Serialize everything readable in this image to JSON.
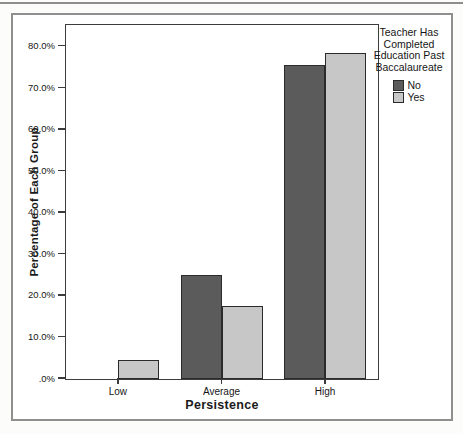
{
  "chart_data": {
    "type": "bar",
    "title": "",
    "categories": [
      "Low",
      "Average",
      "High"
    ],
    "series": [
      {
        "name": "No",
        "color": "#5b5b5b",
        "values": [
          0.0,
          25.0,
          75.5
        ]
      },
      {
        "name": "Yes",
        "color": "#c7c7c7",
        "values": [
          4.5,
          17.5,
          78.5
        ]
      }
    ],
    "xlabel": "Persistence",
    "ylabel": "Percentage of Each Group",
    "ylim": [
      0,
      85
    ],
    "yticks": [
      {
        "value": 0,
        "label": ".0%"
      },
      {
        "value": 10,
        "label": "10.0%"
      },
      {
        "value": 20,
        "label": "20.0%"
      },
      {
        "value": 30,
        "label": "30.0%"
      },
      {
        "value": 40,
        "label": "40.0%"
      },
      {
        "value": 50,
        "label": "50.0%"
      },
      {
        "value": 60,
        "label": "60.0%"
      },
      {
        "value": 70,
        "label": "70.0%"
      },
      {
        "value": 80,
        "label": "80.0%"
      }
    ],
    "legend_title": "Teacher Has Completed Education Past Baccalaureate",
    "legend_position": "right-outside-top",
    "grid": false,
    "colors": {
      "axis": "#3c3c3c",
      "bar_border": "#2b2b2b",
      "frame": "#8f8f8f"
    }
  }
}
